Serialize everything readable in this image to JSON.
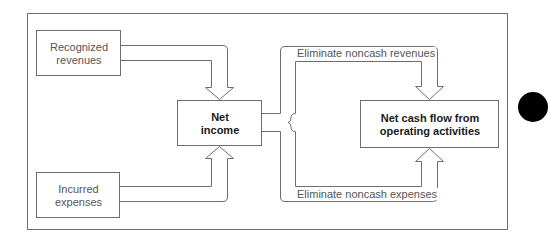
{
  "diagram": {
    "nodes": {
      "recognized_revenues": {
        "line1": "Recognized",
        "line2": "revenues"
      },
      "incurred_expenses": {
        "line1": "Incurred",
        "line2": "expenses"
      },
      "net_income": {
        "line1": "Net",
        "line2": "income"
      },
      "net_cash_flow": {
        "line1": "Net cash flow from",
        "line2": "operating activities"
      }
    },
    "edges": {
      "eliminate_noncash_revenues": "Eliminate noncash revenues",
      "eliminate_noncash_expenses": "Eliminate noncash expenses"
    },
    "colors": {
      "stroke": "#6e6e6e",
      "text": "#555555",
      "bold_text": "#1a1a1a",
      "tab": "#000000"
    }
  }
}
